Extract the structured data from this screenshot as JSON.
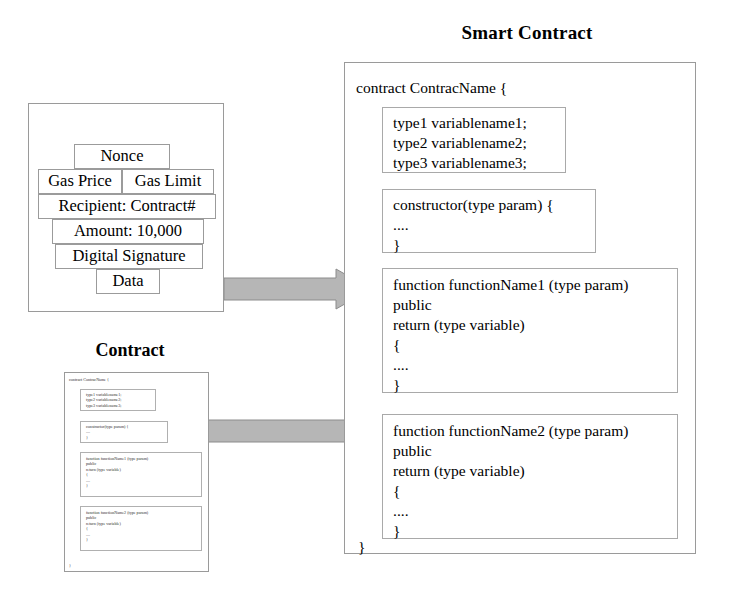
{
  "diagram": {
    "smart_contract_title": "Smart Contract",
    "transaction_title": "Transaction",
    "contract_title": "Contract"
  },
  "transaction": {
    "fields": [
      {
        "label": "Nonce"
      },
      {
        "label": "Gas Price"
      },
      {
        "label": "Gas Limit"
      },
      {
        "label": "Recipient: Contract#"
      },
      {
        "label": "Amount: 10,000"
      },
      {
        "label": "Digital Signature"
      },
      {
        "label": "Data"
      }
    ]
  },
  "smart_contract": {
    "open_line": "contract ContracName {",
    "close_line": "}",
    "variables": {
      "lines": [
        "type1 variablename1;",
        "type2 variablename2;",
        "type3 variablename3;"
      ]
    },
    "constructor": {
      "signature": "constructor(type param) {",
      "body": "....",
      "close": "}"
    },
    "functions": [
      {
        "signature": "function functionName1 (type param)",
        "visibility": "public",
        "returns": "return (type variable)",
        "open": "{",
        "body": "....",
        "close": "}"
      },
      {
        "signature": "function functionName2 (type param)",
        "visibility": "public",
        "returns": "return (type variable)",
        "open": "{",
        "body": "....",
        "close": "}"
      }
    ]
  },
  "contract_thumbnail": {
    "open_line": "contract ContracName {",
    "close_line": "}",
    "variables": {
      "lines": [
        "type1 variablename1;",
        "type2 variablename2;",
        "type3 variablename3;"
      ]
    },
    "constructor": {
      "signature": "constructor(type param) {",
      "body": "....",
      "close": "}"
    },
    "functions": [
      {
        "signature": "function functionName1 (type param)",
        "visibility": "public",
        "returns": "return (type variable)",
        "open": "{",
        "body": "....",
        "close": "}"
      },
      {
        "signature": "function functionName2 (type param)",
        "visibility": "public",
        "returns": "return (type variable)",
        "open": "{",
        "body": "....",
        "close": "}"
      }
    ]
  },
  "arrows": {
    "color": "#b6b6b6",
    "outline": "#8c8c8c",
    "transaction_to_contract": "arrow-right",
    "contract_to_contract": "arrow-right"
  }
}
